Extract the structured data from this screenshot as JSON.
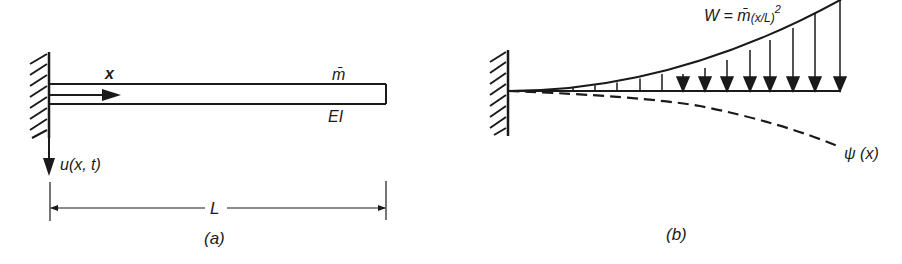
{
  "figure_a": {
    "caption": "(a)",
    "axis_label": "x",
    "mass_label": "m̄",
    "stiffness_label": "EI",
    "displacement_label": "u(x, t)",
    "length_label": "L"
  },
  "figure_b": {
    "caption": "(b)",
    "load_label_main": "W = m̄",
    "load_label_paren": "(x/L)",
    "load_label_exp": "2",
    "shape_label": "ψ (x)"
  },
  "colors": {
    "ink": "#1a1a1a",
    "background": "#ffffff"
  }
}
